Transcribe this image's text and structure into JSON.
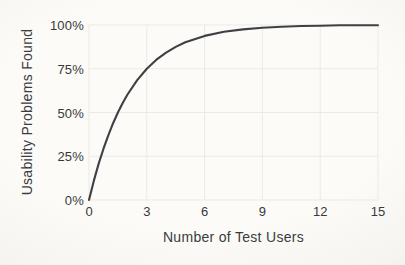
{
  "chart_data": {
    "type": "line",
    "title": "",
    "xlabel": "Number of Test Users",
    "ylabel": "Usability Problems Found",
    "xlim": [
      0,
      15
    ],
    "ylim": [
      0,
      100
    ],
    "grid": true,
    "legend": "none",
    "xticks": [
      {
        "value": 0,
        "label": "0"
      },
      {
        "value": 3,
        "label": "3"
      },
      {
        "value": 6,
        "label": "6"
      },
      {
        "value": 9,
        "label": "9"
      },
      {
        "value": 12,
        "label": "12"
      },
      {
        "value": 15,
        "label": "15"
      }
    ],
    "yticks": [
      {
        "value": 0,
        "label": "0%"
      },
      {
        "value": 25,
        "label": "25%"
      },
      {
        "value": 50,
        "label": "50%"
      },
      {
        "value": 75,
        "label": "75%"
      },
      {
        "value": 100,
        "label": "100%"
      }
    ],
    "series": [
      {
        "name": "usability-problems-found",
        "x": [
          0,
          0.25,
          0.5,
          0.75,
          1,
          1.25,
          1.5,
          1.75,
          2,
          2.5,
          3,
          3.5,
          4,
          4.5,
          5,
          6,
          7,
          8,
          9,
          10,
          11,
          12,
          13,
          14,
          15
        ],
        "y": [
          0,
          10.9,
          20.6,
          29.3,
          37,
          43.9,
          50,
          55.4,
          60.3,
          68.5,
          75,
          80.2,
          84.2,
          87.5,
          90.1,
          93.8,
          96.1,
          97.5,
          98.4,
          99.0,
          99.4,
          99.6,
          99.8,
          99.8,
          99.9
        ]
      }
    ],
    "colors": {
      "curve": "#3e4144",
      "grid": "#ebebe5",
      "text": "#3a3c3e",
      "background": "#fbfaf7"
    }
  }
}
